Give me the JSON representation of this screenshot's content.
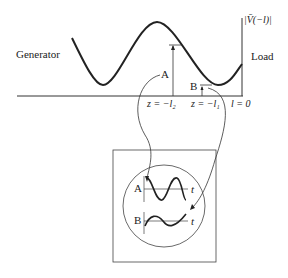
{
  "labels": {
    "generator": "Generator",
    "load": "Load",
    "magnitude": "|V̄(−l)|",
    "point_a": "A",
    "point_b": "B",
    "z_l2": "z = −l₂",
    "z_l1": "z = −l₁",
    "l_zero": "l = 0",
    "inset_a": "A",
    "inset_b": "B",
    "inset_t1": "t",
    "inset_t2": "t"
  },
  "colors": {
    "stroke": "#222222",
    "background": "#ffffff"
  }
}
